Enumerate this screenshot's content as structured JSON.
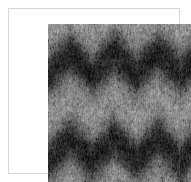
{
  "image": {
    "kind": "grayscale-texture-plate",
    "caption": "",
    "width_px": 191,
    "height_px": 182,
    "background_color": "#ffffff",
    "plate": {
      "left_px": 8,
      "top_px": 8,
      "width_px": 172,
      "height_px": 166
    }
  },
  "texture_data": {
    "type": "heatmap",
    "title": "",
    "colormap": "grayscale",
    "channels": 1,
    "value_range": [
      0,
      255
    ],
    "mean_level": 138,
    "contrast_stddev": 52,
    "grain": {
      "noise_scale_px": 1.6,
      "anisotropy": "vertical-striation",
      "striation_strength": 0.38,
      "speckle_density": 0.55
    },
    "structure": {
      "pattern": "horizontal chevron / zigzag banding",
      "band_period_px": 86,
      "zigzag_period_px": 44,
      "zigzag_amplitude_px": 11,
      "band_count": 2
    },
    "bands": [
      {
        "name": "dark-band-upper",
        "center_y_px": 34,
        "thickness_px": 30,
        "level": 72,
        "role": "dark"
      },
      {
        "name": "light-band-upper",
        "center_y_px": 12,
        "thickness_px": 16,
        "level": 196,
        "role": "light"
      },
      {
        "name": "light-band-mid",
        "center_y_px": 80,
        "thickness_px": 38,
        "level": 198,
        "role": "light"
      },
      {
        "name": "dark-band-lower",
        "center_y_px": 124,
        "thickness_px": 32,
        "level": 66,
        "role": "dark"
      },
      {
        "name": "light-band-lower",
        "center_y_px": 152,
        "thickness_px": 18,
        "level": 178,
        "role": "light"
      }
    ],
    "levels": {
      "darkest": 18,
      "dark": 64,
      "mid": 138,
      "light": 200,
      "brightest": 242
    },
    "palette": {
      "black": "#121212",
      "dark_gray": "#404040",
      "mid_gray": "#8a8a8a",
      "light_gray": "#c8c8c8",
      "white": "#f2f2f2",
      "page_background": "#ffffff"
    },
    "seed": 20240517
  }
}
